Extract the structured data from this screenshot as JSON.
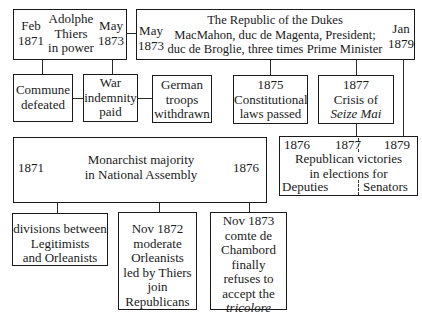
{
  "top_row": {
    "thiers": {
      "start": [
        "Feb",
        "1871"
      ],
      "end": [
        "May",
        "1873"
      ],
      "title": [
        "Adolphe",
        "Thiers",
        "in power"
      ]
    },
    "dukes": {
      "start": [
        "May",
        "1873"
      ],
      "end": [
        "Jan",
        "1879"
      ],
      "title": [
        "The Republic of the Dukes",
        "MacMahon, duc de Magenta, President;",
        "duc de Broglie, three times Prime Minister"
      ]
    }
  },
  "events_row": [
    {
      "lines": [
        "Commune",
        "defeated"
      ]
    },
    {
      "lines": [
        "War",
        "indemnity",
        "paid"
      ]
    },
    {
      "lines": [
        "German",
        "troops",
        "withdrawn"
      ]
    },
    {
      "lines": [
        "1875",
        "Constitutional",
        "laws passed"
      ]
    },
    {
      "lines": [
        "1877",
        "Crisis of",
        "Seize Mai"
      ]
    }
  ],
  "monarchist": {
    "start": "1871",
    "end": "1876",
    "title": [
      "Monarchist majority",
      "in National Assembly"
    ]
  },
  "republican": {
    "years": [
      "1876",
      "1877",
      "1879"
    ],
    "title": [
      "Republican victories",
      "in elections for"
    ],
    "left_label": "Deputies",
    "right_label": "Senators"
  },
  "bottom_row": [
    {
      "lines": [
        "divisions between",
        "Legitimists",
        "and Orleanists"
      ]
    },
    {
      "lines": [
        "Nov 1872",
        "moderate",
        "Orleanists",
        "led by Thiers",
        "join",
        "Republicans"
      ]
    },
    {
      "lines": [
        "Nov 1873",
        "comte de",
        "Chambord",
        "finally",
        "refuses to",
        "accept the",
        "tricolore"
      ]
    }
  ]
}
